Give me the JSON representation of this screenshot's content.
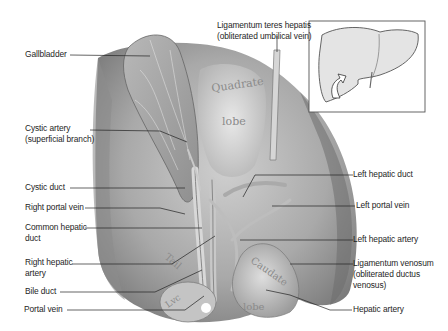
{
  "figure": {
    "type": "anatomical illustration",
    "lobe_labels": [
      "Quadrate lobe",
      "Caudate lobe",
      "Tail"
    ],
    "inset": {
      "description": "Liver outline with arrow indicating viewing direction"
    },
    "colors": {
      "background": "#ffffff",
      "tissue_dark": "#6e6e6e",
      "tissue_light": "#d8d8d8",
      "text": "#1e1e1e",
      "leader": "#222222"
    }
  },
  "labels": {
    "left": [
      {
        "id": "gallbladder",
        "text": "Gallbladder"
      },
      {
        "id": "cystic-artery",
        "text": "Cystic artery\n(superficial branch)"
      },
      {
        "id": "cystic-duct",
        "text": "Cystic duct"
      },
      {
        "id": "right-portal-vein",
        "text": "Right portal vein"
      },
      {
        "id": "common-hepatic-duct",
        "text": "Common hepatic\nduct"
      },
      {
        "id": "right-hepatic-artery",
        "text": "Right hepatic\nartery"
      },
      {
        "id": "bile-duct",
        "text": "Bile duct"
      },
      {
        "id": "portal-vein",
        "text": "Portal vein"
      }
    ],
    "top": [
      {
        "id": "ligamentum-teres",
        "text": "Ligamentum teres hepatis\n(obliterated umbilical vein)"
      }
    ],
    "right": [
      {
        "id": "left-hepatic-duct",
        "text": "Left hepatic duct"
      },
      {
        "id": "left-portal-vein",
        "text": "Left portal vein"
      },
      {
        "id": "left-hepatic-artery",
        "text": "Left hepatic artery"
      },
      {
        "id": "ligamentum-venosum",
        "text": "Ligamentum venosum\n(obliterated ductus\nvenosus)"
      },
      {
        "id": "hepatic-artery",
        "text": "Hepatic artery"
      }
    ]
  },
  "lobe_text": {
    "quadrate_1": "Quadrate",
    "quadrate_2": "lobe",
    "caudate_1": "Caudate",
    "caudate_2": "lobe",
    "tail": "Tail",
    "fragment": "Lvc"
  }
}
